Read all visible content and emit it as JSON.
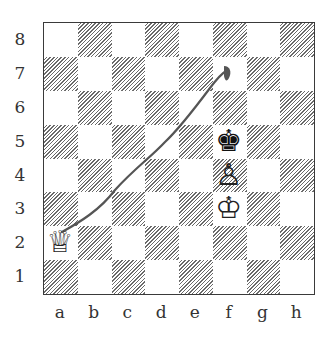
{
  "board": {
    "files": [
      "a",
      "b",
      "c",
      "d",
      "e",
      "f",
      "g",
      "h"
    ],
    "ranks": [
      "8",
      "7",
      "6",
      "5",
      "4",
      "3",
      "2",
      "1"
    ],
    "light_color": "#ffffff",
    "dark_style": "diagonal-hatch",
    "hatch_color": "#6a6a6a",
    "border_color": "#3a3a3a"
  },
  "pieces": [
    {
      "square": "a2",
      "type": "queen",
      "color": "white",
      "glyph": "♕"
    },
    {
      "square": "f3",
      "type": "king",
      "color": "white",
      "glyph": "♔"
    },
    {
      "square": "f4",
      "type": "pawn",
      "color": "white",
      "glyph": "♙"
    },
    {
      "square": "f5",
      "type": "king",
      "color": "black",
      "glyph": "♚"
    }
  ],
  "annotation": {
    "type": "hand-drawn-line",
    "from": "a2",
    "to": "f7",
    "color": "#555555"
  }
}
